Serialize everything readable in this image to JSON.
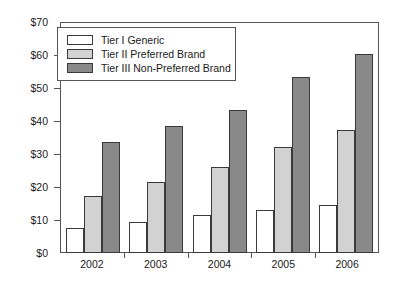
{
  "chart_data": {
    "type": "bar",
    "title": "",
    "xlabel": "",
    "ylabel": "",
    "categories": [
      "2002",
      "2003",
      "2004",
      "2005",
      "2006"
    ],
    "series": [
      {
        "name": "Tier I Generic",
        "color": "#ffffff",
        "values": [
          7.5,
          9.5,
          11.5,
          13.2,
          14.6
        ]
      },
      {
        "name": "Tier II Preferred Brand",
        "color": "#d2d2d2",
        "values": [
          17.5,
          21.5,
          26.3,
          32.4,
          37.3
        ]
      },
      {
        "name": "Tier III Non-Preferred Brand",
        "color": "#898989",
        "values": [
          33.8,
          38.6,
          43.5,
          53.6,
          60.6
        ]
      }
    ],
    "ylim": [
      0,
      70
    ],
    "ytick_values": [
      0,
      10,
      20,
      30,
      40,
      50,
      60,
      70
    ],
    "ytick_labels": [
      "$0",
      "$10",
      "$20",
      "$30",
      "$40",
      "$50",
      "$60",
      "$70"
    ],
    "grid": false,
    "legend_position": "top-left"
  },
  "axes": {
    "y_ticks": [
      {
        "label": "$70",
        "value": 70
      },
      {
        "label": "$60",
        "value": 60
      },
      {
        "label": "$50",
        "value": 50
      },
      {
        "label": "$40",
        "value": 40
      },
      {
        "label": "$30",
        "value": 30
      },
      {
        "label": "$20",
        "value": 20
      },
      {
        "label": "$10",
        "value": 10
      },
      {
        "label": "$0",
        "value": 0
      }
    ],
    "x_categories": [
      "2002",
      "2003",
      "2004",
      "2005",
      "2006"
    ]
  },
  "legend": {
    "items": [
      {
        "label": "Tier I Generic",
        "swatch": "tier1"
      },
      {
        "label": "Tier II Preferred Brand",
        "swatch": "tier2"
      },
      {
        "label": "Tier III Non-Preferred Brand",
        "swatch": "tier3"
      }
    ]
  },
  "colors": {
    "tier1": "#ffffff",
    "tier2": "#d2d2d2",
    "tier3": "#898989",
    "axis": "#555555",
    "bar_outline": "#3a3a3a",
    "text": "#1a1a1a"
  }
}
